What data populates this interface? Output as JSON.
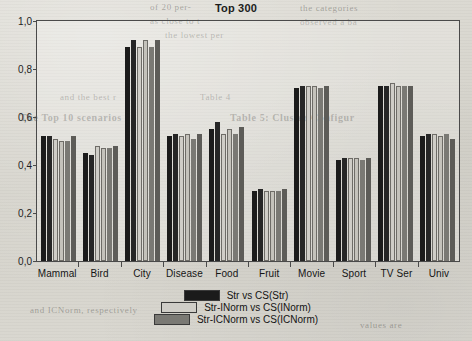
{
  "chart_data": {
    "type": "bar",
    "title": "Top 300",
    "xlabel": "",
    "ylabel": "",
    "ylim": [
      0,
      1.0
    ],
    "ytick_labels": [
      "0,0",
      "0,2",
      "0,4",
      "0,6",
      "0,8",
      "1,0"
    ],
    "ytick_values": [
      0,
      0.2,
      0.4,
      0.6,
      0.8,
      1.0
    ],
    "grid": false,
    "legend_position": "bottom-center",
    "categories": [
      "Mammal",
      "Bird",
      "City",
      "Disease",
      "Food",
      "Fruit",
      "Movie",
      "Sport",
      "TV Ser",
      "Univ"
    ],
    "series": [
      {
        "name": "Str vs CS(Str)",
        "color": "#1b1b1b",
        "values": [
          0.52,
          0.45,
          0.89,
          0.52,
          0.55,
          0.29,
          0.72,
          0.42,
          0.73,
          0.52
        ]
      },
      {
        "name": "Str vs CS(Str) 2",
        "color": "#262626",
        "values": [
          0.52,
          0.44,
          0.92,
          0.53,
          0.58,
          0.3,
          0.73,
          0.43,
          0.73,
          0.53
        ]
      },
      {
        "name": "Str-INorm vs CS(INorm)",
        "color": "#cfcdc7",
        "values": [
          0.51,
          0.48,
          0.89,
          0.52,
          0.53,
          0.29,
          0.73,
          0.43,
          0.74,
          0.53
        ]
      },
      {
        "name": "Str-INorm vs CS(INorm) 2",
        "color": "#c4c2bb",
        "values": [
          0.5,
          0.47,
          0.92,
          0.53,
          0.55,
          0.29,
          0.73,
          0.43,
          0.73,
          0.52
        ]
      },
      {
        "name": "Str-ICNorm vs CS(ICNorm)",
        "color": "#7a7974",
        "values": [
          0.5,
          0.47,
          0.89,
          0.51,
          0.53,
          0.29,
          0.72,
          0.42,
          0.73,
          0.53
        ]
      },
      {
        "name": "Str-ICNorm vs CS(ICNorm) 2",
        "color": "#5d5c58",
        "values": [
          0.52,
          0.48,
          0.92,
          0.53,
          0.56,
          0.3,
          0.73,
          0.43,
          0.73,
          0.51
        ]
      }
    ],
    "legend": [
      {
        "label": "Str vs CS(Str)",
        "color": "#1b1b1b"
      },
      {
        "label": "Str-INorm  vs CS(INorm)",
        "color": "#cfcdc7"
      },
      {
        "label": "Str-ICNorm  vs CS(ICNorm)",
        "color": "#7a7974"
      }
    ]
  },
  "background_text": [
    "of 20 per-",
    "the categories",
    "as close to t",
    "observed a ba",
    "the lowest per",
    "and the best r",
    "Table 4",
    "The Top 10 scenarios",
    "Table 5: Cluster Configur",
    "and ICNorm, respectively",
    "values are"
  ]
}
